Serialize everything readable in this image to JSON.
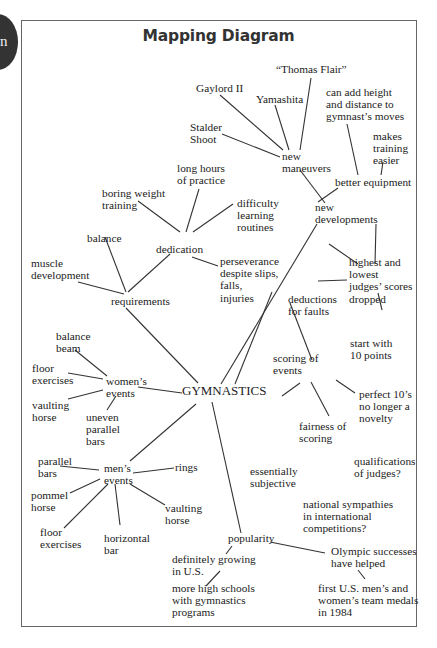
{
  "tab": {
    "letter": "n"
  },
  "title": "Mapping Diagram",
  "central_topic": "GYMNASTICS",
  "nodes": {
    "thomas_flair": "“Thomas Flair”",
    "gaylord": "Gaylord II",
    "yamashita": "Yamashita",
    "can_add_height": "can add height\nand distance to\ngymnast’s moves",
    "stalder": "Stalder\nShoot",
    "makes_training": "makes\ntraining\neasier",
    "new_maneuvers": "new\nmaneuvers",
    "long_hours": "long hours\nof practice",
    "better_equipment": "better equipment",
    "boring_weight": "boring weight\ntraining",
    "difficulty": "difficulty\nlearning\nroutines",
    "new_developments": "new\ndevelopments",
    "balance": "balance",
    "dedication": "dedication",
    "muscle": "muscle\ndevelopment",
    "perseverance": "perseverance\ndespite slips,\nfalls,\ninjuries",
    "highest_lowest": "highest and\nlowest\njudges’ scores\ndropped",
    "requirements": "requirements",
    "deductions": "deductions\nfor faults",
    "balance_beam": "balance\nbeam",
    "start_with": "start with\n10 points",
    "scoring_of_events": "scoring of\nevents",
    "floor_ex_w": "floor\nexercises",
    "womens_events": "women’s\nevents",
    "perfect_10": "perfect 10’s\nno longer a\nnovelty",
    "vaulting_w": "vaulting\nhorse",
    "uneven_bars": "uneven\nparallel\nbars",
    "fairness": "fairness of\nscoring",
    "parallel_bars": "parallel\nbars",
    "rings": "rings",
    "mens_events": "men’s\nevents",
    "qualifications": "qualifications\nof judges?",
    "essentially": "essentially\nsubjective",
    "pommel": "pommel\nhorse",
    "vaulting_m": "vaulting\nhorse",
    "national": "national sympathies\nin international\ncompetitions?",
    "floor_ex_m": "floor\nexercises",
    "horizontal_bar": "horizontal\nbar",
    "popularity": "popularity",
    "olympic": "Olympic successes\nhave helped",
    "definitely": "definitely growing\nin U.S.",
    "more_high_schools": "more high schools\nwith gymnastics\nprograms",
    "first_us": "first U.S. men’s and\nwomen’s team medals\nin 1984"
  }
}
